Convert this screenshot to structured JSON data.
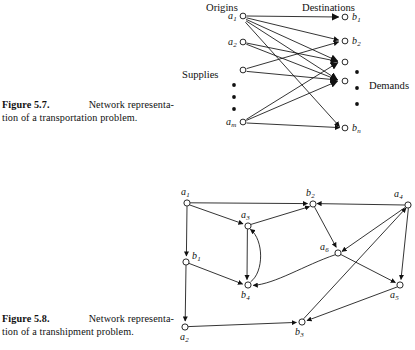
{
  "figure_transportation": {
    "headers": {
      "origins": "Origins",
      "destinations": "Destinations",
      "supplies": "Supplies",
      "demands": "Demands"
    },
    "origin_nodes": [
      {
        "id": "a1",
        "label": "a",
        "sub": "1",
        "x": 243,
        "y": 16
      },
      {
        "id": "a2",
        "label": "a",
        "sub": "2",
        "x": 243,
        "y": 42
      },
      {
        "id": "a3",
        "label": "",
        "sub": "",
        "x": 243,
        "y": 70
      },
      {
        "id": "am",
        "label": "a",
        "sub": "m",
        "x": 243,
        "y": 122
      }
    ],
    "destination_nodes": [
      {
        "id": "b1",
        "label": "b",
        "sub": "1",
        "x": 345,
        "y": 17
      },
      {
        "id": "b2",
        "label": "b",
        "sub": "2",
        "x": 345,
        "y": 41
      },
      {
        "id": "b3",
        "label": "",
        "sub": "",
        "x": 345,
        "y": 62
      },
      {
        "id": "b4",
        "label": "",
        "sub": "",
        "x": 345,
        "y": 81
      },
      {
        "id": "bn",
        "label": "b",
        "sub": "n",
        "x": 345,
        "y": 128
      }
    ],
    "origin_ellipsis": [
      {
        "x": 234,
        "y": 85
      },
      {
        "x": 234,
        "y": 97
      },
      {
        "x": 234,
        "y": 109
      }
    ],
    "destination_ellipsis": [
      {
        "x": 356,
        "y": 72
      },
      {
        "x": 356,
        "y": 88
      },
      {
        "x": 356,
        "y": 104
      }
    ],
    "edges": [
      {
        "from": "a1",
        "to": "b1"
      },
      {
        "from": "a1",
        "to": "b2"
      },
      {
        "from": "a1",
        "to": "b3"
      },
      {
        "from": "a1",
        "to": "b4"
      },
      {
        "from": "a1",
        "to": "bn"
      },
      {
        "from": "a2",
        "to": "b3"
      },
      {
        "from": "a2",
        "to": "b4"
      },
      {
        "from": "a3",
        "to": "b2"
      },
      {
        "from": "a3",
        "to": "b4"
      },
      {
        "from": "am",
        "to": "b3"
      },
      {
        "from": "am",
        "to": "b4"
      },
      {
        "from": "am",
        "to": "bn"
      }
    ]
  },
  "figure_transhipment": {
    "nodes": [
      {
        "id": "a1",
        "label": "a",
        "sub": "1",
        "x": 187,
        "y": 203,
        "lx": 181,
        "ly": 194,
        "anchor": "above"
      },
      {
        "id": "b1",
        "label": "b",
        "sub": "1",
        "x": 186,
        "y": 262,
        "lx": 193,
        "ly": 258,
        "anchor": "right"
      },
      {
        "id": "a2",
        "label": "a",
        "sub": "2",
        "x": 185,
        "y": 327,
        "lx": 180,
        "ly": 340,
        "anchor": "below"
      },
      {
        "id": "a3",
        "label": "a",
        "sub": "3",
        "x": 248,
        "y": 226,
        "lx": 242,
        "ly": 218,
        "anchor": "above"
      },
      {
        "id": "b4",
        "label": "b",
        "sub": "4",
        "x": 248,
        "y": 285,
        "lx": 242,
        "ly": 298,
        "anchor": "below"
      },
      {
        "id": "b2",
        "label": "b",
        "sub": "2",
        "x": 313,
        "y": 204,
        "lx": 307,
        "ly": 196,
        "anchor": "above"
      },
      {
        "id": "b3",
        "label": "b",
        "sub": "3",
        "x": 302,
        "y": 322,
        "lx": 296,
        "ly": 335,
        "anchor": "below"
      },
      {
        "id": "a6",
        "label": "a",
        "sub": "6",
        "x": 338,
        "y": 253,
        "lx": 321,
        "ly": 249,
        "anchor": "left"
      },
      {
        "id": "a4",
        "label": "a",
        "sub": "4",
        "x": 408,
        "y": 205,
        "lx": 396,
        "ly": 196,
        "anchor": "above"
      },
      {
        "id": "a5",
        "label": "a",
        "sub": "5",
        "x": 400,
        "y": 285,
        "lx": 392,
        "ly": 298,
        "anchor": "below"
      }
    ],
    "edges": [
      {
        "from": "a1",
        "to": "b1",
        "kind": "straight"
      },
      {
        "from": "a1",
        "to": "b2",
        "kind": "straight"
      },
      {
        "from": "a1",
        "to": "a3",
        "kind": "straight"
      },
      {
        "from": "b1",
        "to": "a2",
        "kind": "straight"
      },
      {
        "from": "b1",
        "to": "b4",
        "kind": "straight"
      },
      {
        "from": "a3",
        "to": "b2",
        "kind": "straight"
      },
      {
        "from": "a3",
        "to": "b4",
        "kind": "straight"
      },
      {
        "from": "b4",
        "to": "a3",
        "kind": "curve"
      },
      {
        "from": "a4",
        "to": "b2",
        "kind": "straight"
      },
      {
        "from": "b2",
        "to": "a6",
        "kind": "straight"
      },
      {
        "from": "a4",
        "to": "a6",
        "kind": "straight"
      },
      {
        "from": "a4",
        "to": "a5",
        "kind": "straight"
      },
      {
        "from": "a6",
        "to": "a5",
        "kind": "straight"
      },
      {
        "from": "a6",
        "to": "b4",
        "kind": "straight"
      },
      {
        "from": "b3",
        "to": "a4",
        "kind": "straight"
      },
      {
        "from": "a5",
        "to": "b3",
        "kind": "straight"
      },
      {
        "from": "a2",
        "to": "b3",
        "kind": "straight"
      }
    ]
  },
  "captions": {
    "fig57": {
      "lead": "Figure 5.7.",
      "line1_rest": "Network representa-",
      "line2": "tion of a transportation problem."
    },
    "fig58": {
      "lead": "Figure 5.8.",
      "line1_rest": "Network representa-",
      "line2": "tion of a transhipment problem."
    }
  },
  "style": {
    "stroke": "#111111",
    "node_fill": "#ffffff",
    "background": "#ffffff"
  }
}
